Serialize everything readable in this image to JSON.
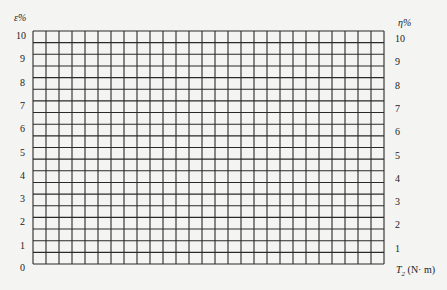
{
  "chart_data": {
    "type": "line",
    "title": "",
    "left_axis": {
      "label": "ε%",
      "ticks": [
        "0",
        "1",
        "2",
        "3",
        "4",
        "5",
        "6",
        "7",
        "8",
        "9",
        "10"
      ],
      "range": [
        0,
        10
      ]
    },
    "right_axis": {
      "label": "η%",
      "ticks": [
        "1",
        "2",
        "3",
        "4",
        "5",
        "6",
        "7",
        "8",
        "9",
        "10"
      ],
      "range": [
        0,
        10
      ]
    },
    "x_axis": {
      "label": "T₂ (N· m)",
      "ticks": []
    },
    "grid": {
      "on": true,
      "columns": 27,
      "rows": 20
    },
    "series": []
  },
  "labels": {
    "left_title": "ε%",
    "right_title": "η%",
    "x_title_main": "T",
    "x_title_sub": "2",
    "x_title_unit": " (N· m)",
    "zero": "0"
  },
  "colors": {
    "grid": "#2a2a2a",
    "background": "#f4f4f2"
  }
}
